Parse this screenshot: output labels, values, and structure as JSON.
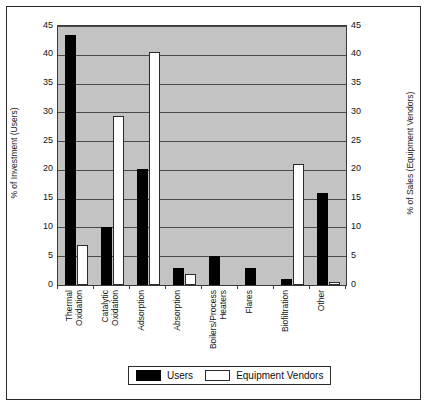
{
  "chart_data": {
    "type": "bar",
    "title": "",
    "categories": [
      "Thermal Oxidation",
      "Catalytic Oxidation",
      "Adsorption",
      "Absorption",
      "Boilers/Process Heaters",
      "Flares",
      "Biofiltration",
      "Other"
    ],
    "category_lines": [
      [
        "Thermal",
        "Oxidation"
      ],
      [
        "Catalytic",
        "Oxidation"
      ],
      [
        "Adsorption"
      ],
      [
        "Absorption"
      ],
      [
        "Boilers/Process",
        "Heaters"
      ],
      [
        "Flares"
      ],
      [
        "Biofiltration"
      ],
      [
        "Other"
      ]
    ],
    "series": [
      {
        "name": "Users",
        "color": "#000000",
        "axis": "left",
        "values": [
          43.5,
          10,
          20.2,
          3,
          5,
          3,
          1,
          16
        ]
      },
      {
        "name": "Equipment Vendors",
        "color": "#ffffff",
        "axis": "right",
        "values": [
          7,
          29.3,
          40.5,
          2,
          0,
          0,
          21,
          0.5
        ]
      }
    ],
    "xlabel": "",
    "ylabel": "% of Investment (Users)",
    "y2label": "% of Sales (Equipment Vendors)",
    "ylim": [
      0,
      45
    ],
    "y2lim": [
      0,
      45
    ],
    "yticks": [
      0,
      5,
      10,
      15,
      20,
      25,
      30,
      35,
      40,
      45
    ],
    "y2ticks": [
      0,
      5,
      10,
      15,
      20,
      25,
      30,
      35,
      40,
      45
    ],
    "grid": true,
    "legend_position": "bottom",
    "plot_background": "#c3c3c3"
  },
  "axes": {
    "left_title": "% of Investment (Users)",
    "right_title": "% of Sales (Equipment Vendors)",
    "ticks": [
      "45",
      "40",
      "35",
      "30",
      "25",
      "20",
      "15",
      "10",
      "5",
      "0"
    ]
  },
  "legend": {
    "items": [
      {
        "label": "Users",
        "color": "#000000"
      },
      {
        "label": "Equipment Vendors",
        "color": "#ffffff"
      }
    ]
  }
}
